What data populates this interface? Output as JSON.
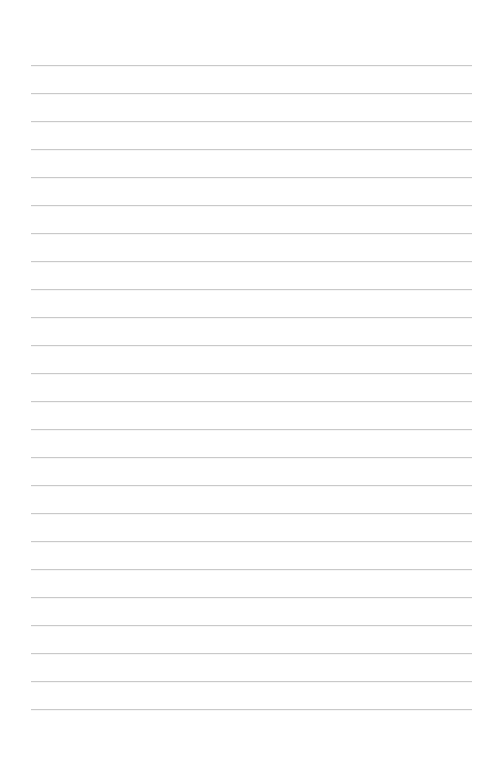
{
  "page": {
    "type": "lined-paper",
    "background_color": "#ffffff",
    "line_color": "#c9c9c9",
    "line_count": 24,
    "first_line_y": 65,
    "line_spacing": 28,
    "line_left": 31,
    "line_right": 472
  }
}
